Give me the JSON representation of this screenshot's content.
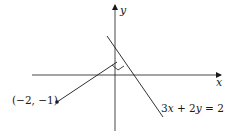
{
  "diagram": {
    "axes": {
      "x_label": "x",
      "y_label": "y"
    },
    "point": {
      "label": "(−2, −1)",
      "x": -2,
      "y": -1
    },
    "line": {
      "label_parts": [
        "3",
        "x",
        " + 2",
        "y",
        " = 2"
      ],
      "equation": "3x + 2y = 2"
    },
    "annotations": {
      "right_angle_marker": true,
      "perpendicular_segment": "from (−2, −1) to line 3x + 2y = 2"
    },
    "colors": {
      "stroke": "#1a1a1a",
      "background": "#ffffff"
    }
  }
}
